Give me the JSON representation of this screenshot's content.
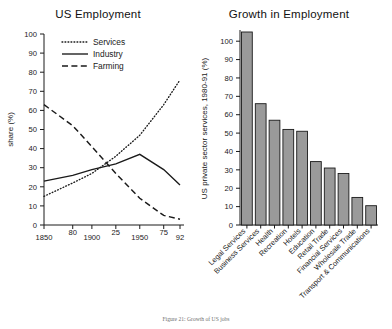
{
  "figure": {
    "caption": "Figure 21: Growth of US jobs"
  },
  "chart_data": [
    {
      "type": "line",
      "title": "US Employment",
      "xlabel": "",
      "ylabel": "share (%)",
      "ylim": [
        0,
        100
      ],
      "yticks": [
        0,
        10,
        20,
        30,
        40,
        50,
        60,
        70,
        80,
        90,
        100
      ],
      "xtick_labels": [
        "1850",
        "80",
        "1900",
        "25",
        "1950",
        "75",
        "92"
      ],
      "xtick_years": [
        1850,
        1880,
        1900,
        1925,
        1950,
        1975,
        1992
      ],
      "xlim": [
        1850,
        1992
      ],
      "grid": false,
      "legend_position": "top-left",
      "series": [
        {
          "name": "Services",
          "style": "dotted",
          "x": [
            1850,
            1880,
            1900,
            1925,
            1950,
            1975,
            1992
          ],
          "values": [
            15,
            22,
            27,
            36,
            47,
            63,
            76
          ]
        },
        {
          "name": "Industry",
          "style": "solid",
          "x": [
            1850,
            1880,
            1900,
            1925,
            1950,
            1975,
            1992
          ],
          "values": [
            23,
            26,
            29,
            32,
            37,
            29,
            21
          ]
        },
        {
          "name": "Farming",
          "style": "dashed",
          "x": [
            1850,
            1880,
            1900,
            1925,
            1950,
            1975,
            1992
          ],
          "values": [
            63,
            52,
            41,
            27,
            14,
            5,
            3
          ]
        }
      ]
    },
    {
      "type": "bar",
      "title": "Growth in Employment",
      "xlabel": "",
      "ylabel": "US private sector services, 1980-91 (%)",
      "ylim": [
        0,
        105
      ],
      "yticks": [
        0,
        10,
        20,
        30,
        40,
        50,
        60,
        70,
        80,
        90,
        100
      ],
      "grid": false,
      "bar_color": "#9a9a9a",
      "bar_edge_color": "#1a1a1a",
      "categories": [
        "Legal Services",
        "Business Services",
        "Health",
        "Recreation",
        "Hotels",
        "Education",
        "Retail Trade",
        "Financial Services",
        "Wholesale Trade",
        "Transport & Communications"
      ],
      "values": [
        105,
        66,
        57,
        52,
        51,
        34.5,
        31,
        28,
        15,
        10.5
      ]
    }
  ]
}
